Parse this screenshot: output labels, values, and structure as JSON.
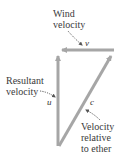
{
  "diagram": {
    "labels": {
      "wind_line1": "Wind",
      "wind_line2": "velocity",
      "resultant_line1": "Resultant",
      "resultant_line2": "velocity",
      "ether_line1": "Velocity",
      "ether_line2": "relative",
      "ether_line3": "to ether"
    },
    "vectors": {
      "v": "v⃗",
      "u": "u⃗",
      "c": "c⃗"
    },
    "colors": {
      "arrow": "#a6a6a6",
      "text": "#3a3a3a",
      "pointer": "#555555"
    }
  }
}
